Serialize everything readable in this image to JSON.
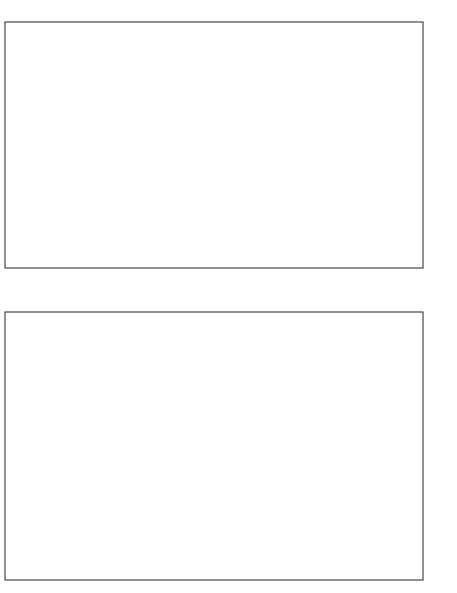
{
  "chart_data": [
    {
      "id": "drag-moment",
      "type": "line",
      "title": "NACA 4415 — section drag and moment coefficients",
      "ylabel": "Section lift coefficient, c_l",
      "ylim": [
        -1.6,
        1.6
      ],
      "ytick_labels": [
        "-1.6",
        "-1.2",
        "-.8",
        "-.4",
        "0",
        ".4",
        ".8",
        "1.2",
        "1.6"
      ],
      "xlabel_drag": "Section drag coefficient, c_d",
      "xlim_drag": [
        0.024,
        0
      ],
      "xtick_labels_drag": [
        ".024",
        ".020",
        ".016",
        ".012",
        ".008",
        ".004",
        "0"
      ],
      "xlabel_moment": "Moment coefficient, c_m c/4",
      "xlim_moment": [
        0,
        -0.5
      ],
      "xtick_labels_moment": [
        "0",
        "-.1",
        "-.2",
        "-.3",
        "-.4",
        "-.5"
      ],
      "grid": true,
      "series": [
        {
          "name": "R 3.0×10^6",
          "marker": "circle",
          "cl": [
            -0.5,
            -0.3,
            -0.1,
            0.1,
            0.3,
            0.5,
            0.7,
            0.9,
            1.1,
            1.3,
            1.45
          ],
          "cd": [
            0.0095,
            0.0085,
            0.0078,
            0.0074,
            0.0072,
            0.0073,
            0.0076,
            0.008,
            0.009,
            0.0108,
            0.014
          ]
        },
        {
          "name": "R 6.0×10^6",
          "marker": "square",
          "cl": [
            -0.6,
            -0.4,
            -0.2,
            0.0,
            0.2,
            0.4,
            0.6,
            0.8,
            1.0,
            1.2,
            1.4,
            1.5
          ],
          "cd": [
            0.0089,
            0.008,
            0.0073,
            0.0068,
            0.0066,
            0.0066,
            0.0068,
            0.0072,
            0.0079,
            0.0092,
            0.0118,
            0.0138
          ]
        },
        {
          "name": "R 9.0×10^6",
          "marker": "diamond",
          "cl": [
            -0.6,
            -0.4,
            -0.2,
            0.0,
            0.2,
            0.4,
            0.6,
            0.8,
            1.0,
            1.2,
            1.4,
            1.55
          ],
          "cd": [
            0.0081,
            0.0076,
            0.007,
            0.0066,
            0.0064,
            0.0065,
            0.0067,
            0.0071,
            0.0077,
            0.0088,
            0.0106,
            0.0135
          ]
        },
        {
          "name": "R 6.0×10^6 standard roughness",
          "marker": "triangle",
          "cl": [
            -0.3,
            -0.1,
            0.1,
            0.3,
            0.5,
            0.7,
            0.9,
            1.1,
            1.3
          ],
          "cd": [
            0.015,
            0.0128,
            0.0116,
            0.011,
            0.0112,
            0.0118,
            0.0132,
            0.016,
            0.0224
          ]
        }
      ],
      "moment_series": {
        "name": "c_m c/4 (all R)",
        "cl": [
          -0.7,
          -0.5,
          -0.3,
          -0.1,
          0.1,
          0.3,
          0.5,
          0.7,
          0.9,
          1.1,
          1.3,
          1.45
        ],
        "cm": [
          -0.075,
          -0.088,
          -0.09,
          -0.092,
          -0.093,
          -0.094,
          -0.094,
          -0.095,
          -0.095,
          -0.094,
          -0.094,
          -0.095
        ]
      },
      "legend": {
        "header": [
          "R",
          "a.c. position",
          "x/c",
          "y/c"
        ],
        "rows": [
          {
            "symbol": "○",
            "R": "3.0×10^6",
            "xc": "0.241",
            "yc": "-0.068"
          },
          {
            "symbol": "□",
            "R": "6.0",
            "xc": ".241",
            "yc": "-.040"
          },
          {
            "symbol": "◇",
            "R": "9.0",
            "xc": ".245",
            "yc": "-.040"
          },
          {
            "symbol": "△",
            "R": "6.0",
            "note": "Standard roughness"
          },
          {
            "symbol": "",
            "R": "",
            "note": "0.20c simulated split flap deflected 60°"
          },
          {
            "symbol": "▽",
            "R": "6.0",
            "note": ""
          }
        ]
      }
    },
    {
      "id": "airfoil-section",
      "type": "line",
      "title": "NACA 4415 section profile",
      "xlabel": "x/c",
      "ylabel": "y/c",
      "xtick_labels": [
        "0",
        ".2",
        ".4",
        ".6",
        ".8",
        "1.0"
      ],
      "ytick_labels": [
        ".2",
        "0",
        "-.2"
      ]
    },
    {
      "id": "lift",
      "type": "line",
      "title": "NACA 4415 — section lift coefficient vs angle of attack",
      "xlabel": "Section lift coefficient, c_l",
      "ylabel": "Section angle of attack, α_0, deg",
      "xlim": [
        3.6,
        -2.0
      ],
      "xtick_labels": [
        "3.6",
        "3.2",
        "2.8",
        "2.4",
        "2.0",
        "1.6",
        "1.2",
        ".8",
        ".4",
        "0",
        "-.4",
        "-.8",
        "-1.2",
        "-1.6",
        "-2.0"
      ],
      "ylim": [
        -32,
        32
      ],
      "ytick_labels": [
        "-32",
        "-24",
        "-16",
        "-8",
        "0",
        "8",
        "16",
        "24",
        "32"
      ],
      "secondary_xtick_labels_right": [
        "-.5"
      ],
      "grid": true,
      "series": [
        {
          "name": "Clean, R 3.0/6.0/9.0×10^6",
          "alpha": [
            -16,
            -14,
            -12,
            -10,
            -8,
            -6,
            -4,
            -2,
            0,
            2,
            4,
            6,
            8,
            10,
            12,
            13,
            14,
            15,
            16,
            18,
            20
          ],
          "cl": [
            -0.9,
            -1.0,
            -0.95,
            -0.8,
            -0.4,
            -0.2,
            0.0,
            0.2,
            0.4,
            0.6,
            0.8,
            1.0,
            1.15,
            1.3,
            1.42,
            1.48,
            1.55,
            1.5,
            1.45,
            1.5,
            1.55
          ]
        },
        {
          "name": "Split flap deflected 60°, R 6.0×10^6",
          "alpha": [
            -16,
            -14,
            -12,
            -10,
            -8,
            -6,
            -4,
            -2,
            0,
            2,
            4,
            6,
            8,
            10,
            12,
            13,
            14,
            16
          ],
          "cl": [
            0.3,
            0.5,
            0.85,
            1.1,
            1.3,
            1.5,
            1.7,
            1.9,
            2.1,
            2.3,
            2.45,
            2.55,
            2.7,
            2.78,
            2.9,
            2.9,
            2.85,
            2.75
          ]
        }
      ],
      "moment_series": {
        "name": "c_m c/4 vs alpha",
        "alpha": [
          -16,
          -12,
          -8,
          -4,
          0,
          4,
          8,
          12,
          16,
          20
        ],
        "cm": [
          -0.06,
          -0.08,
          -0.09,
          -0.09,
          -0.092,
          -0.094,
          -0.094,
          -0.09,
          -0.09,
          -0.1
        ]
      }
    }
  ]
}
